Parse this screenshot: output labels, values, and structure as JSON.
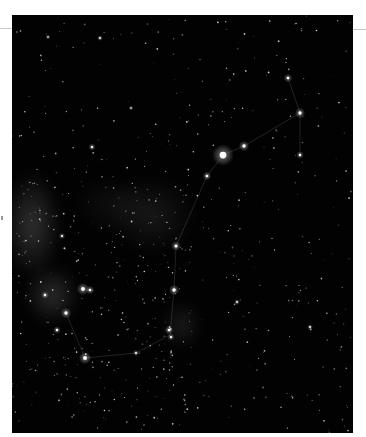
{
  "image": {
    "subject": "Scorpius constellation star field",
    "alt": "Night sky photograph of the Scorpius constellation with Milky Way glow",
    "frame": {
      "x": 12,
      "y": 15,
      "width": 341,
      "height": 418
    },
    "background_color": "#020202",
    "bright_stars": [
      {
        "x": 211,
        "y": 140,
        "r": 4.5,
        "label": "antares"
      },
      {
        "x": 232,
        "y": 131,
        "r": 2.2
      },
      {
        "x": 195,
        "y": 161,
        "r": 1.8
      },
      {
        "x": 276,
        "y": 63,
        "r": 1.8
      },
      {
        "x": 288,
        "y": 98,
        "r": 2.2
      },
      {
        "x": 288,
        "y": 140,
        "r": 1.6
      },
      {
        "x": 164,
        "y": 231,
        "r": 2.0
      },
      {
        "x": 162,
        "y": 275,
        "r": 2.2
      },
      {
        "x": 71,
        "y": 274,
        "r": 2.6
      },
      {
        "x": 78,
        "y": 275,
        "r": 1.8
      },
      {
        "x": 54,
        "y": 298,
        "r": 2.2
      },
      {
        "x": 45,
        "y": 315,
        "r": 1.6
      },
      {
        "x": 33,
        "y": 280,
        "r": 1.6
      },
      {
        "x": 73,
        "y": 343,
        "r": 2.6
      },
      {
        "x": 157,
        "y": 315,
        "r": 1.8
      },
      {
        "x": 159,
        "y": 322,
        "r": 1.5
      },
      {
        "x": 124,
        "y": 338,
        "r": 1.3
      },
      {
        "x": 88,
        "y": 23,
        "r": 1.2
      },
      {
        "x": 36,
        "y": 22,
        "r": 1.0
      },
      {
        "x": 80,
        "y": 132,
        "r": 1.5
      },
      {
        "x": 50,
        "y": 221,
        "r": 1.3
      },
      {
        "x": 225,
        "y": 287,
        "r": 1.2
      },
      {
        "x": 298,
        "y": 312,
        "r": 1.2
      },
      {
        "x": 119,
        "y": 93,
        "r": 1.0
      }
    ],
    "constellation_lines": [
      [
        [
          288,
          98
        ],
        [
          232,
          131
        ],
        [
          211,
          140
        ],
        [
          195,
          161
        ],
        [
          164,
          231
        ],
        [
          162,
          275
        ],
        [
          158,
          320
        ]
      ],
      [
        [
          276,
          63
        ],
        [
          288,
          98
        ]
      ],
      [
        [
          288,
          98
        ],
        [
          288,
          140
        ]
      ],
      [
        [
          158,
          320
        ],
        [
          124,
          338
        ],
        [
          73,
          343
        ],
        [
          54,
          298
        ]
      ]
    ],
    "nebula_glow": [
      {
        "x": 20,
        "y": 210,
        "rx": 30,
        "ry": 55,
        "opacity": 0.22
      },
      {
        "x": 40,
        "y": 280,
        "rx": 28,
        "ry": 30,
        "opacity": 0.2
      },
      {
        "x": 140,
        "y": 200,
        "rx": 45,
        "ry": 40,
        "opacity": 0.1
      },
      {
        "x": 170,
        "y": 310,
        "rx": 20,
        "ry": 25,
        "opacity": 0.12
      },
      {
        "x": 100,
        "y": 190,
        "rx": 40,
        "ry": 30,
        "opacity": 0.06
      }
    ]
  },
  "star_field": {
    "count": 650,
    "seed": 7
  }
}
